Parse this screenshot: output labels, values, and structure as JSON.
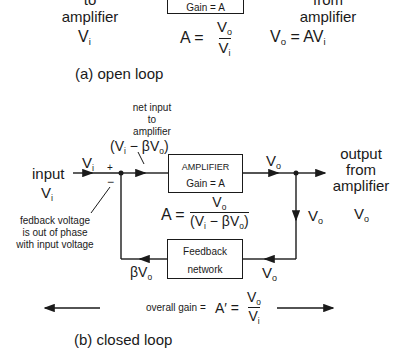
{
  "open_loop": {
    "left_label_line1": "to",
    "left_label_line2": "amplifier",
    "left_var": "V",
    "left_var_sub": "i",
    "box_gain": "Gain = A",
    "gain_lhs": "A =",
    "gain_num": "V",
    "gain_num_sub": "o",
    "gain_den": "V",
    "gain_den_sub": "i",
    "right_label_line1": "from",
    "right_label_line2": "amplifier",
    "output_eq_lhs": "V",
    "output_eq_lhs_sub": "o",
    "output_eq_rhs": " = AV",
    "output_eq_rhs_sub": "i",
    "caption": "(a) open loop"
  },
  "closed_loop": {
    "net_input_line1": "net input",
    "net_input_line2": "to",
    "net_input_line3": "amplifier",
    "net_input_expr_a": "(V",
    "net_input_expr_a_sub": "i",
    "net_input_expr_b": " − βV",
    "net_input_expr_b_sub": "o",
    "net_input_expr_c": ")",
    "input_label": "input",
    "input_var": "V",
    "input_var_sub": "i",
    "wire_vi": "V",
    "wire_vi_sub": "i",
    "plus_sign": "+",
    "minus_sign": "−",
    "feedback_note_line1": "fedback voltage",
    "feedback_note_line2": "is out of phase",
    "feedback_note_line3": "with input voltage",
    "amp_box_title": "AMPLIFIER",
    "amp_box_gain": "Gain = A",
    "gain_lhs": "A =",
    "gain_num": "V",
    "gain_num_sub": "o",
    "gain_den_a": "(V",
    "gain_den_a_sub": "i",
    "gain_den_b": " − βV",
    "gain_den_b_sub": "o",
    "gain_den_c": ")",
    "wire_vo_top": "V",
    "wire_vo_top_sub": "o",
    "output_line1": "output",
    "output_line2": "from",
    "output_line3": "amplifier",
    "output_var": "V",
    "output_var_sub": "o",
    "wire_vo_right": "V",
    "wire_vo_right_sub": "o",
    "feedback_box_line1": "Feedback",
    "feedback_box_line2": "network",
    "wire_vo_bottom": "V",
    "wire_vo_bottom_sub": "o",
    "wire_bvo": "βV",
    "wire_bvo_sub": "o",
    "overall_gain_label": "overall gain  =",
    "overall_gain_lhs": "A′ =",
    "overall_gain_num": "V",
    "overall_gain_num_sub": "o",
    "overall_gain_den": "V",
    "overall_gain_den_sub": "i",
    "caption": "(b) closed loop"
  }
}
